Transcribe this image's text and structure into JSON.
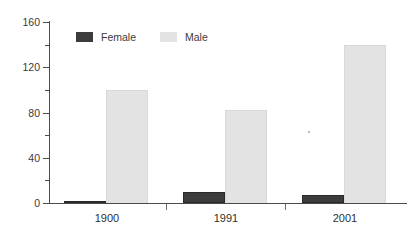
{
  "chart_data": {
    "type": "bar",
    "title": "",
    "subtitle": "",
    "xlabel": "",
    "ylabel": "",
    "categories": [
      "1900",
      "1991",
      "2001"
    ],
    "series": [
      {
        "name": "Female",
        "color": "#3c3c3c",
        "values": [
          2,
          10,
          7
        ]
      },
      {
        "name": "Male",
        "color": "#e3e3e3",
        "values": [
          100,
          82,
          140
        ]
      }
    ],
    "ylim": [
      0,
      160
    ],
    "y_major_ticks": [
      0,
      40,
      80,
      120,
      160
    ],
    "y_major_tick_labels": [
      "0",
      "40",
      "80",
      "120",
      "160"
    ],
    "y_minor_ticks": [
      20,
      60,
      100,
      140
    ],
    "grid": false,
    "legend_position": "top-left-inside",
    "legend": [
      "Female",
      "Male"
    ],
    "annotations": []
  },
  "legend": {
    "items": [
      {
        "label": "Female",
        "swatch": "legend-swatch-female"
      },
      {
        "label": "Male",
        "swatch": "legend-swatch-male"
      }
    ]
  },
  "axes": {
    "y_labels": [
      "160",
      "120",
      "80",
      "40",
      "0"
    ],
    "x_labels": [
      "1900",
      "1991",
      "2001"
    ]
  },
  "colors": {
    "female": "#3c3c3c",
    "male": "#e3e3e3",
    "axis": "#4a4a4a",
    "text": "#3b3b3b",
    "background": "#ffffff"
  }
}
